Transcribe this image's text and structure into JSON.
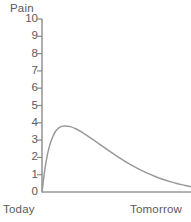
{
  "chart_data": {
    "type": "line",
    "title": "",
    "ylabel": "Pain",
    "xlabel": "",
    "ylim": [
      0,
      10
    ],
    "xlim": [
      0,
      1
    ],
    "grid": false,
    "legend": "none",
    "y_ticks": [
      "10",
      "9",
      "8",
      "7",
      "6",
      "5",
      "4",
      "3",
      "2",
      "1",
      "0"
    ],
    "y_tick_values": [
      10,
      9,
      8,
      7,
      6,
      5,
      4,
      3,
      2,
      1,
      0
    ],
    "x_tick_labels": [
      "Today",
      "Tomorrow"
    ],
    "x_tick_values": [
      0,
      1
    ],
    "series": [
      {
        "name": "Pain level",
        "color": "#999999",
        "x": [
          0.0,
          0.01,
          0.02,
          0.035,
          0.05,
          0.07,
          0.09,
          0.12,
          0.15,
          0.19,
          0.23,
          0.27,
          0.31,
          0.36,
          0.41,
          0.46,
          0.51,
          0.56,
          0.61,
          0.66,
          0.71,
          0.76,
          0.81,
          0.86,
          0.91,
          0.96,
          1.0
        ],
        "y": [
          0.0,
          0.7,
          1.35,
          2.1,
          2.65,
          3.15,
          3.5,
          3.75,
          3.82,
          3.78,
          3.64,
          3.45,
          3.22,
          2.92,
          2.62,
          2.32,
          2.03,
          1.76,
          1.51,
          1.28,
          1.08,
          0.9,
          0.74,
          0.6,
          0.48,
          0.38,
          0.3
        ]
      },
      {
        "name": "Baseline",
        "color": "#999999",
        "x": [
          0,
          1
        ],
        "y": [
          0,
          0
        ]
      }
    ],
    "peak": {
      "x": 0.15,
      "y": 3.8
    },
    "end_value": 0.3
  },
  "colors": {
    "curve": "#999999",
    "axis": "#8a8a8a",
    "text": "#5a5a5a",
    "background": "#ffffff"
  },
  "geometry": {
    "axis_x": 42,
    "axis_top_y": 19,
    "axis_bottom_y": 192,
    "plot_right_x": 191,
    "tick_length": 5
  }
}
